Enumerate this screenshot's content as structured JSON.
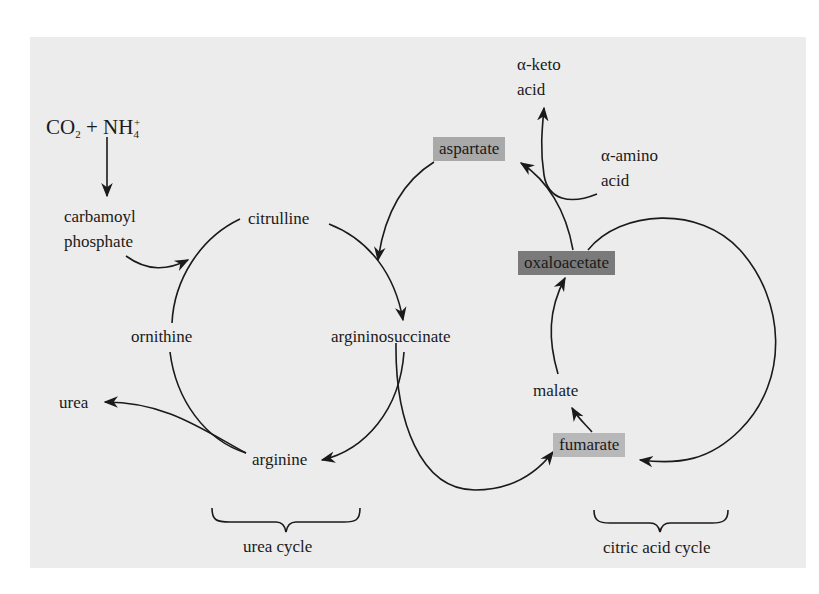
{
  "diagram": {
    "inputs": {
      "co2": "CO",
      "co2_sub": "2",
      "plus": "+",
      "nh4": "NH",
      "nh4_sub": "4",
      "nh4_sup": "+"
    },
    "urea_cycle": {
      "label": "urea cycle",
      "nodes": {
        "carbamoyl_line1": "carbamoyl",
        "carbamoyl_line2": "phosphate",
        "citrulline": "citrulline",
        "argininosuccinate": "argininosuccinate",
        "arginine": "arginine",
        "ornithine": "ornithine",
        "urea": "urea"
      }
    },
    "citric_acid_cycle": {
      "label": "citric acid cycle",
      "nodes": {
        "oxaloacetate": "oxaloacetate",
        "malate": "malate",
        "fumarate": "fumarate"
      }
    },
    "transamination": {
      "aspartate": "aspartate",
      "keto_line1": "α-keto",
      "keto_line2": "acid",
      "amino_line1": "α-amino",
      "amino_line2": "acid"
    },
    "colors": {
      "panel_bg": "#ececec",
      "page_bg": "#ffffff",
      "line": "#1a1a1a",
      "aspartate_box": "#a9a9a9",
      "oxaloacetate_box": "#7a7a7a",
      "fumarate_box": "#b8b8b8"
    }
  }
}
